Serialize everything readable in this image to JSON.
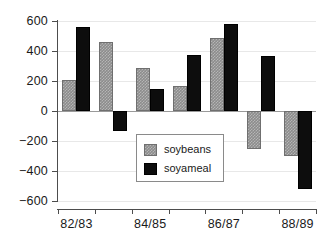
{
  "chart_data": {
    "type": "bar",
    "title": "",
    "xlabel": "",
    "ylabel": "",
    "ylim": [
      -600,
      600
    ],
    "grid": true,
    "legend_position": "center",
    "categories": [
      "82/83",
      "83/84",
      "84/85",
      "85/86",
      "86/87",
      "87/88",
      "88/89"
    ],
    "tick_labels_shown": [
      "82/83",
      "",
      "84/85",
      "",
      "86/87",
      "",
      "88/89"
    ],
    "ytick_labels": [
      "600",
      "400",
      "200",
      "0",
      "−200",
      "−400",
      "−600"
    ],
    "ytick_values": [
      600,
      400,
      200,
      0,
      -200,
      -400,
      -600
    ],
    "series": [
      {
        "name": "soybeans",
        "color": "#8c8c8c",
        "values": [
          205,
          460,
          285,
          165,
          490,
          -250,
          -300
        ]
      },
      {
        "name": "soyameal",
        "color": "#0d0d0d",
        "values": [
          560,
          -135,
          150,
          375,
          580,
          365,
          -520
        ]
      }
    ]
  },
  "legend": {
    "items": [
      {
        "label": "soybeans",
        "swatch": "soybeans-swatch"
      },
      {
        "label": "soyameal",
        "swatch": "soyameal-swatch"
      }
    ]
  }
}
